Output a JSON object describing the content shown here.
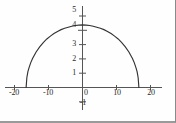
{
  "chart_data": {
    "type": "line",
    "title": "",
    "subtitle": "",
    "xlabel": "",
    "ylabel": "",
    "xlim": [
      -22,
      22
    ],
    "ylim": [
      -1.5,
      5.4
    ],
    "grid": false,
    "legend": null,
    "annotations": [],
    "x_ticks": [
      -20,
      -10,
      0,
      10,
      20
    ],
    "x_tick_labels": [
      "-20",
      "-10",
      "0",
      "10",
      "20"
    ],
    "y_ticks": [
      -1,
      1,
      2,
      3,
      4,
      5
    ],
    "y_tick_labels": [
      "-1",
      "1",
      "2",
      "3",
      "4",
      "5"
    ],
    "zero_label": "0",
    "curve_color": "#333333",
    "axis_color": "#555555",
    "series": [
      {
        "name": "upper semi-ellipse",
        "description": "downward-opening arc from (-15.8, 0) rising to peak (0, 4.15) and back to (15.8, 0)",
        "x": [
          -15.8,
          -15.6,
          -15.3,
          -15.0,
          -14.5,
          -14.0,
          -13.0,
          -12.0,
          -11.0,
          -10.0,
          -9.0,
          -8.0,
          -7.0,
          -6.0,
          -5.0,
          -4.0,
          -3.0,
          -2.0,
          -1.0,
          0.0,
          1.0,
          2.0,
          3.0,
          4.0,
          5.0,
          6.0,
          7.0,
          8.0,
          9.0,
          10.0,
          11.0,
          12.0,
          13.0,
          14.0,
          14.5,
          15.0,
          15.3,
          15.6,
          15.8
        ],
        "y": [
          0.0,
          0.65,
          1.05,
          1.3,
          1.65,
          1.93,
          2.36,
          2.7,
          2.98,
          3.22,
          3.41,
          3.58,
          3.72,
          3.84,
          3.93,
          4.0,
          4.06,
          4.11,
          4.14,
          4.15,
          4.14,
          4.11,
          4.06,
          4.0,
          3.93,
          3.84,
          3.72,
          3.58,
          3.41,
          3.22,
          2.98,
          2.7,
          2.36,
          1.93,
          1.65,
          1.3,
          1.05,
          0.65,
          0.0
        ]
      }
    ]
  },
  "axes": {
    "x_axis_name": "horizontal axis",
    "y_axis_name": "vertical axis"
  }
}
